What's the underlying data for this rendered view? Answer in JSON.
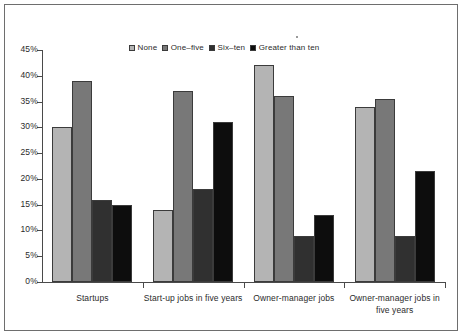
{
  "chart_data": {
    "type": "bar",
    "title": "",
    "subtitle": "",
    "xlabel": "",
    "ylabel": "",
    "ylim": [
      0,
      45
    ],
    "ytick_values": [
      0,
      5,
      10,
      15,
      20,
      25,
      30,
      35,
      40,
      45
    ],
    "ytick_labels": [
      "0%",
      "5%",
      "10%",
      "15%",
      "20%",
      "25%",
      "30%",
      "35%",
      "40%",
      "45%"
    ],
    "grid": false,
    "legend_position": "top-center",
    "categories": [
      "Startups",
      "Start-up jobs in five years",
      "Owner-manager jobs",
      "Owner-manager jobs in five years"
    ],
    "series": [
      {
        "name": "None",
        "color": "#b4b4b4",
        "values": [
          30,
          14,
          42,
          34
        ]
      },
      {
        "name": "One–five",
        "color": "#787878",
        "values": [
          39,
          37,
          36,
          35.5
        ]
      },
      {
        "name": "Six–ten",
        "color": "#303030",
        "values": [
          16,
          18,
          9,
          9
        ]
      },
      {
        "name": "Greater than ten",
        "color": "#0d0d0d",
        "values": [
          15,
          31,
          13,
          21.5
        ]
      }
    ]
  },
  "legend": {
    "items": [
      {
        "label": "None"
      },
      {
        "label": "One–five"
      },
      {
        "label": "Six–ten"
      },
      {
        "label": "Greater than ten"
      }
    ]
  },
  "axis": {
    "y_labels": [
      "45%",
      "40%",
      "35%",
      "30%",
      "25%",
      "20%",
      "15%",
      "10%",
      "5%",
      "0%"
    ],
    "x_labels": [
      "Startups",
      "Start-up jobs in five years",
      "Owner-manager jobs",
      "Owner-manager jobs in five years"
    ]
  }
}
